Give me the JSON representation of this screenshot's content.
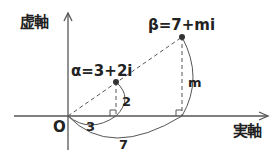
{
  "diagram": {
    "type": "complex-plane",
    "axes": {
      "imaginary_label": "虚軸",
      "real_label": "実軸",
      "origin_label": "O"
    },
    "points": [
      {
        "name": "alpha",
        "label": "α=3+2i",
        "re": 3,
        "im": 2
      },
      {
        "name": "beta",
        "label": "β=7+mi",
        "re": 7,
        "im": "m"
      }
    ],
    "measurements": {
      "alpha_re": "3",
      "alpha_im": "2",
      "beta_re": "7",
      "beta_im": "m"
    },
    "colors": {
      "line": "#555555",
      "text": "#222222",
      "point": "#333333"
    }
  }
}
